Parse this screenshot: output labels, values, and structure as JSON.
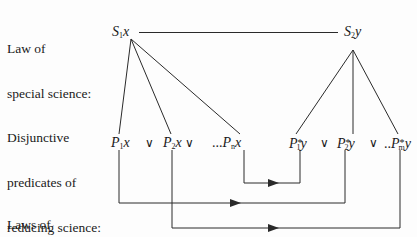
{
  "labels": {
    "law_special": [
      "Law of",
      "special science:"
    ],
    "disjunctive": [
      "Disjunctive",
      "predicates of",
      "reducing science:"
    ],
    "laws_reducing": [
      "Laws of",
      "reducing science:"
    ]
  },
  "nodes": {
    "s1": {
      "letter": "S",
      "sub": "1",
      "var": "x"
    },
    "s2": {
      "letter": "S",
      "sub": "2",
      "var": "y"
    },
    "p1": {
      "letter": "P",
      "sub": "1",
      "var": "x"
    },
    "p2": {
      "letter": "P",
      "sub": "2",
      "var": "x"
    },
    "pn": {
      "prefix": "...",
      "letter": "P",
      "sub": "n",
      "var": "x"
    },
    "q1": {
      "letter": "P",
      "sup": "*",
      "sub": "1",
      "var": "y"
    },
    "q2": {
      "letter": "P",
      "sup": "*",
      "sub": "2",
      "var": "y"
    },
    "qm": {
      "prefix": "..",
      "letter": "P",
      "sup": "*",
      "sub": "m",
      "var": "y"
    }
  },
  "operators": {
    "or": "∨"
  },
  "colors": {
    "line": "#2a2a2a",
    "text": "#1a1a1a",
    "background": "#fdfdfd"
  }
}
